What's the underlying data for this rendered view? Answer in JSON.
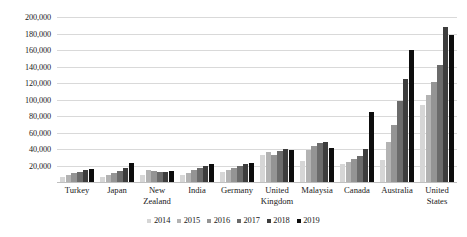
{
  "chart_data": {
    "type": "bar",
    "title": "",
    "subtitle": "",
    "xlabel": "",
    "ylabel": "",
    "ylim": [
      0,
      200000
    ],
    "ytick_labels": [
      "200,000",
      "180,000",
      "160,000",
      "140,000",
      "120,000",
      "100,000",
      "80,000",
      "60,000",
      "40,000",
      "20,000",
      ""
    ],
    "ytick_values": [
      200000,
      180000,
      160000,
      140000,
      120000,
      100000,
      80000,
      60000,
      40000,
      20000,
      0
    ],
    "grid": true,
    "legend_position": "bottom",
    "categories": [
      "Turkey",
      "Japan",
      "New Zealand",
      "India",
      "Germany",
      "United Kingdom",
      "Malaysia",
      "Canada",
      "Australia",
      "United States"
    ],
    "series": [
      {
        "name": "2014",
        "color": "#d6d6d6",
        "values": [
          6000,
          5500,
          9000,
          9000,
          12000,
          33000,
          26000,
          22000,
          27000,
          93000
        ]
      },
      {
        "name": "2015",
        "color": "#b3b3b3",
        "values": [
          8500,
          8000,
          14000,
          11000,
          15000,
          36000,
          39000,
          24000,
          49000,
          106000
        ]
      },
      {
        "name": "2016",
        "color": "#949494",
        "values": [
          10500,
          10500,
          13000,
          14000,
          17000,
          33000,
          44000,
          28000,
          69000,
          121000
        ]
      },
      {
        "name": "2017",
        "color": "#6b6b6b",
        "values": [
          12500,
          13500,
          12500,
          16500,
          20000,
          37000,
          47000,
          32000,
          98000,
          142000
        ]
      },
      {
        "name": "2018",
        "color": "#3d3d3d",
        "values": [
          14000,
          17000,
          12000,
          19500,
          22000,
          40000,
          48000,
          40000,
          125000,
          188000
        ]
      },
      {
        "name": "2019",
        "color": "#0d0d0d",
        "values": [
          15500,
          22500,
          13000,
          22000,
          22500,
          39000,
          41000,
          85000,
          160000,
          178000
        ]
      }
    ]
  }
}
